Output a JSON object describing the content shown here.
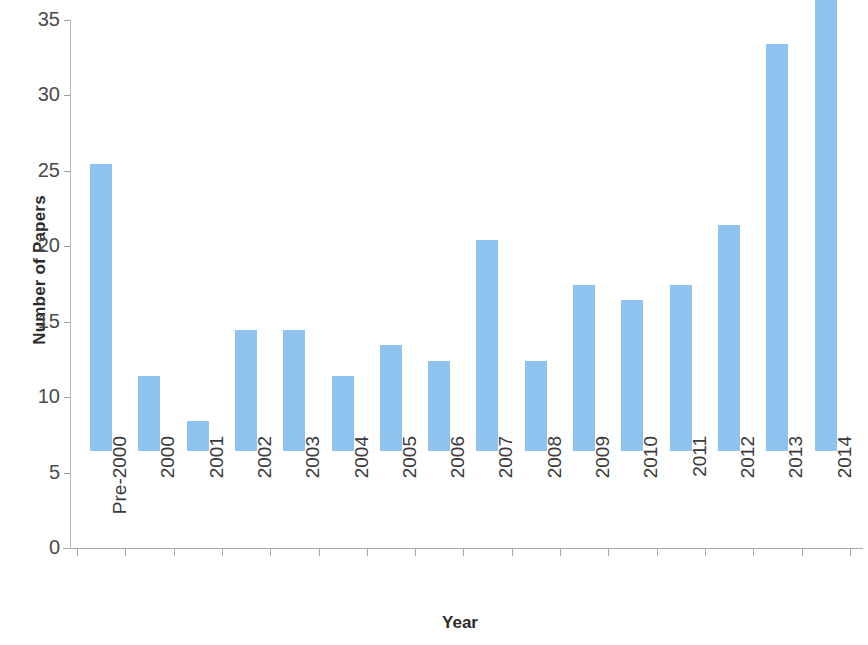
{
  "chart_data": {
    "type": "bar",
    "title": "",
    "xlabel": "Year",
    "ylabel": "Number of Papers",
    "categories": [
      "Pre-2000",
      "2000",
      "2001",
      "2002",
      "2003",
      "2004",
      "2005",
      "2006",
      "2007",
      "2008",
      "2009",
      "2010",
      "2011",
      "2012",
      "2013",
      "2014"
    ],
    "values": [
      19,
      5,
      2,
      8,
      8,
      5,
      7,
      6,
      14,
      6,
      11,
      10,
      11,
      15,
      27,
      34
    ],
    "series": [
      {
        "name": "Number of Papers",
        "values": [
          19,
          5,
          2,
          8,
          8,
          5,
          7,
          6,
          14,
          6,
          11,
          10,
          11,
          15,
          27,
          34
        ]
      }
    ],
    "ylim": [
      0,
      35
    ],
    "y_ticks": [
      0,
      5,
      10,
      15,
      20,
      25,
      30,
      35
    ],
    "y_tick_labels": [
      "0",
      "5",
      "10",
      "15",
      "20",
      "25",
      "30",
      "35"
    ],
    "grid": false,
    "legend": false,
    "legend_position": "none",
    "bar_color": "#8fc3ef",
    "axis_color": "#a6a6a6",
    "text_color": "#3a3a3a"
  }
}
